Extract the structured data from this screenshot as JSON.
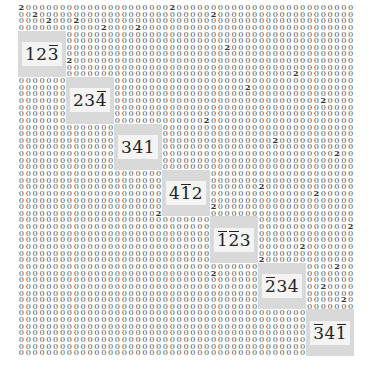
{
  "grid": {
    "cols": 49,
    "header_rows": 4,
    "block_size": 7,
    "background_digit": "0",
    "header": [
      {
        "row": 0,
        "twos": [
          0,
          22
        ]
      },
      {
        "row": 1,
        "twos": [
          2,
          28
        ]
      },
      {
        "row": 2,
        "twos": [
          4,
          8
        ]
      },
      {
        "row": 3,
        "twos": [
          12,
          17
        ]
      }
    ],
    "scattered_twos": [
      [
        6,
        30
      ],
      [
        8,
        7
      ],
      [
        10,
        40
      ],
      [
        12,
        33
      ],
      [
        14,
        44
      ],
      [
        15,
        9
      ],
      [
        17,
        27
      ],
      [
        19,
        14
      ],
      [
        20,
        37
      ],
      [
        22,
        46
      ],
      [
        23,
        19
      ],
      [
        25,
        25
      ],
      [
        27,
        35
      ],
      [
        28,
        43
      ],
      [
        30,
        28
      ],
      [
        31,
        20
      ],
      [
        33,
        48
      ],
      [
        35,
        32
      ],
      [
        36,
        41
      ],
      [
        38,
        35
      ],
      [
        39,
        46
      ],
      [
        40,
        28
      ],
      [
        42,
        44
      ],
      [
        43,
        36
      ],
      [
        44,
        47
      ],
      [
        46,
        45
      ],
      [
        47,
        42
      ],
      [
        49,
        47
      ],
      [
        50,
        45
      ],
      [
        51,
        48
      ],
      [
        52,
        45
      ]
    ]
  },
  "blocks": [
    {
      "index": 0,
      "label": [
        {
          "d": "1",
          "bar": false
        },
        {
          "d": "2",
          "bar": false
        },
        {
          "d": "3",
          "bar": true
        }
      ]
    },
    {
      "index": 1,
      "label": [
        {
          "d": "2",
          "bar": false
        },
        {
          "d": "3",
          "bar": false
        },
        {
          "d": "4",
          "bar": true
        }
      ]
    },
    {
      "index": 2,
      "label": [
        {
          "d": "3",
          "bar": false
        },
        {
          "d": "4",
          "bar": false
        },
        {
          "d": "1",
          "bar": false
        }
      ]
    },
    {
      "index": 3,
      "label": [
        {
          "d": "4",
          "bar": false
        },
        {
          "d": "1",
          "bar": true
        },
        {
          "d": "2",
          "bar": false
        }
      ]
    },
    {
      "index": 4,
      "label": [
        {
          "d": "1",
          "bar": true
        },
        {
          "d": "2",
          "bar": true
        },
        {
          "d": "3",
          "bar": false
        }
      ]
    },
    {
      "index": 5,
      "label": [
        {
          "d": "2",
          "bar": true
        },
        {
          "d": "3",
          "bar": false
        },
        {
          "d": "4",
          "bar": false
        }
      ]
    },
    {
      "index": 6,
      "label": [
        {
          "d": "3",
          "bar": true
        },
        {
          "d": "4",
          "bar": false
        },
        {
          "d": "1",
          "bar": true
        }
      ]
    }
  ],
  "colors": {
    "block_outer": "#d9d9d9",
    "block_inner": "#f4f4f4",
    "digit": "#555555"
  }
}
